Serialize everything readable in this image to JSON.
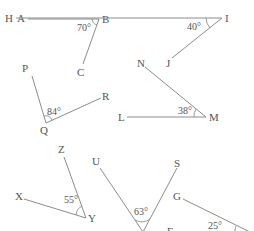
{
  "diagram": {
    "title": "",
    "colors": {
      "line": "#8c8c8c",
      "text": "#555555",
      "background": "#ffffff"
    },
    "angles": [
      {
        "name": "ABC",
        "points": [
          "A",
          "B",
          "C"
        ],
        "vertex": "B",
        "measure": "70°",
        "right_angle_marker": true
      },
      {
        "name": "HIJ",
        "points": [
          "H",
          "I",
          "J"
        ],
        "vertex": "I",
        "measure": "40°"
      },
      {
        "name": "PQR",
        "points": [
          "P",
          "Q",
          "R"
        ],
        "vertex": "Q",
        "measure": "84°"
      },
      {
        "name": "NML",
        "points": [
          "N",
          "M",
          "L"
        ],
        "vertex": "M",
        "measure": "38°"
      },
      {
        "name": "ZYX",
        "points": [
          "Z",
          "Y",
          "X"
        ],
        "vertex": "Y",
        "measure": "55°"
      },
      {
        "name": "UVS",
        "points": [
          "U",
          "S"
        ],
        "vertex": "",
        "measure": "63°"
      },
      {
        "name": "GFE",
        "points": [
          "G",
          "F"
        ],
        "vertex": "",
        "measure": "25°"
      }
    ],
    "labels": {
      "A": "A",
      "B": "B",
      "C": "C",
      "H": "H",
      "I": "I",
      "J": "J",
      "P": "P",
      "Q": "Q",
      "R": "R",
      "N": "N",
      "M": "M",
      "L": "L",
      "Z": "Z",
      "Y": "Y",
      "X": "X",
      "U": "U",
      "S": "S",
      "G": "G",
      "F": "F"
    }
  }
}
